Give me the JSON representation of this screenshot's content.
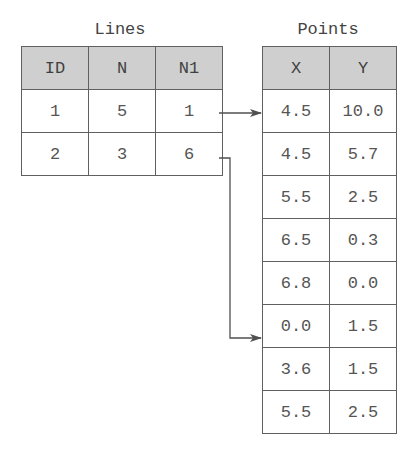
{
  "lines": {
    "title": "Lines",
    "columns": [
      "ID",
      "N",
      "N1"
    ],
    "rows": [
      [
        "1",
        "5",
        "1"
      ],
      [
        "2",
        "3",
        "6"
      ]
    ]
  },
  "points": {
    "title": "Points",
    "columns": [
      "X",
      "Y"
    ],
    "rows": [
      [
        "4.5",
        "10.0"
      ],
      [
        "4.5",
        "5.7"
      ],
      [
        "5.5",
        "2.5"
      ],
      [
        "6.5",
        "0.3"
      ],
      [
        "6.8",
        "0.0"
      ],
      [
        "0.0",
        "1.5"
      ],
      [
        "3.6",
        "1.5"
      ],
      [
        "5.5",
        "2.5"
      ]
    ]
  },
  "connections": [
    {
      "from_line_row": 1,
      "to_point_row": 1
    },
    {
      "from_line_row": 2,
      "to_point_row": 6
    }
  ],
  "colors": {
    "header_fill": "#cfcfcf",
    "border": "#606060",
    "arrow": "#505050"
  }
}
